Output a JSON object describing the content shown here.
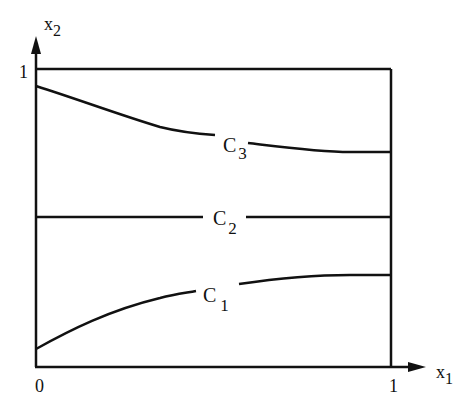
{
  "axes": {
    "x_label": "x",
    "x_sub": "1",
    "y_label": "x",
    "y_sub": "2",
    "x_ticks": [
      "0",
      "1"
    ],
    "y_ticks": [
      "1"
    ]
  },
  "curves": [
    {
      "name": "C",
      "sub": "3"
    },
    {
      "name": "C",
      "sub": "2"
    },
    {
      "name": "C",
      "sub": "1"
    }
  ],
  "colors": {
    "ink": "#111111",
    "background": "#ffffff"
  }
}
